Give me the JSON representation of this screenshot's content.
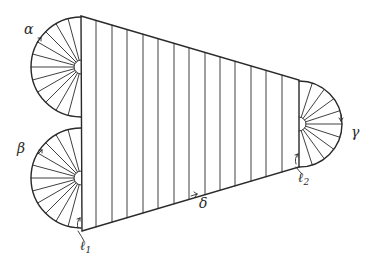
{
  "diagram": {
    "type": "geometric-figure",
    "labels": {
      "alpha": "α",
      "beta": "β",
      "gamma": "γ",
      "delta": "δ",
      "l1_main": "ℓ",
      "l1_sub": "1",
      "l2_main": "ℓ",
      "l2_sub": "2"
    },
    "trapezoid": {
      "top_left": [
        81,
        16
      ],
      "top_right": [
        299,
        80
      ],
      "bottom_right": [
        299,
        167
      ],
      "bottom_left": [
        82,
        231
      ],
      "hatch_x": [
        96,
        112,
        127,
        143,
        158,
        174,
        189,
        205,
        220,
        235,
        251,
        266,
        282
      ]
    },
    "fans": [
      {
        "name": "alpha",
        "cx": 81,
        "cy": 67,
        "r": 50,
        "side": "left",
        "spokes": 12
      },
      {
        "name": "beta",
        "cx": 81,
        "cy": 178,
        "r": 50,
        "side": "left",
        "spokes": 12
      },
      {
        "name": "gamma",
        "cx": 299,
        "cy": 124,
        "r": 43,
        "side": "right",
        "spokes": 10
      }
    ],
    "colors": {
      "stroke": "#2a2a2a",
      "background": "#ffffff"
    }
  }
}
